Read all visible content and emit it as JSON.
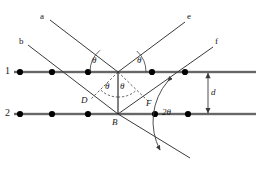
{
  "figure": {
    "type": "bragg-diffraction-diagram",
    "width": 256,
    "height": 176,
    "background": "#ffffff",
    "line_color": "#3a3a3a",
    "atom_color": "#000000",
    "text_color": "#1a1a1a"
  },
  "labels": {
    "ray_a": "a",
    "ray_b": "b",
    "ray_e": "e",
    "ray_f": "f",
    "plane_1": "1",
    "plane_2": "2",
    "point_B": "B",
    "point_D": "D",
    "point_F": "F",
    "spacing_d": "d",
    "theta_incident_upper": "θ",
    "theta_scattered_upper": "θ",
    "theta_left_lower": "θ",
    "theta_right_lower": "θ",
    "two_theta": "2θ"
  },
  "geometry": {
    "plane1_y": 72,
    "plane2_y": 114,
    "vertex_A": {
      "x": 118,
      "y": 72
    },
    "vertex_B": {
      "x": 118,
      "y": 114
    },
    "plane1_x_start": 14,
    "plane1_x_end": 256,
    "plane2_x_start": 14,
    "plane2_x_end": 256,
    "atoms_plane1_x": [
      20,
      52,
      88,
      152,
      185
    ],
    "atoms_plane2_x": [
      20,
      52,
      88,
      155,
      188
    ],
    "atom_radius": 3.1,
    "ray_a_start": {
      "x": 50,
      "y": 20
    },
    "ray_e_end": {
      "x": 185,
      "y": 22
    },
    "ray_b_start": {
      "x": 28,
      "y": 45
    },
    "ray_f_end": {
      "x": 213,
      "y": 47
    },
    "transmitted_end": {
      "x": 190,
      "y": 158
    },
    "dim_line_x": 208
  },
  "annotations": {
    "description": "Bragg reflection from two parallel atomic planes separated by distance d. Incident rays a and b reflect as rays e and f at angle theta; the scattering angle is 2 theta.",
    "path_difference_points": [
      "D",
      "B",
      "F"
    ]
  }
}
